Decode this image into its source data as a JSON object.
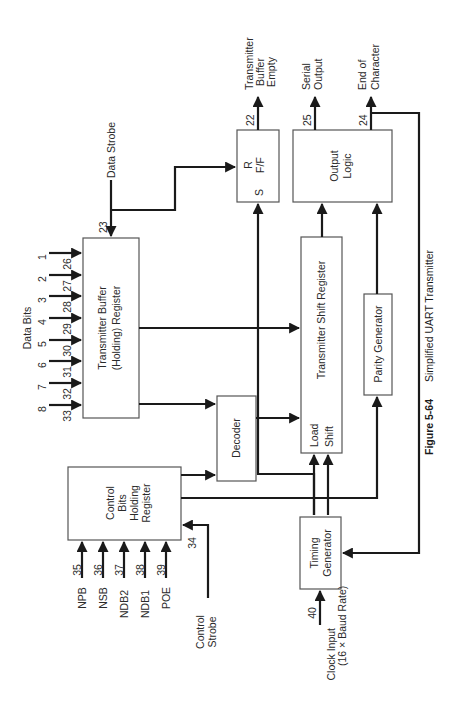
{
  "figure": {
    "number": "Figure 5-64",
    "title": "Simplified UART Transmitter"
  },
  "blocks": {
    "tbr": {
      "line1": "Transmitter Buffer",
      "line2": "(Holding) Register"
    },
    "decoder": {
      "label": "Decoder"
    },
    "cbhr": {
      "line1": "Control",
      "line2": "Bits",
      "line3": "Holding",
      "line4": "Register"
    },
    "rff": {
      "r": "R",
      "ff": "F/F",
      "s": "S"
    },
    "output_logic": {
      "line1": "Output",
      "line2": "Logic"
    },
    "tsr": {
      "label": "Transmitter Shift Register",
      "load": "Load",
      "shift": "Shift"
    },
    "parity": {
      "label": "Parity Generator"
    },
    "timing": {
      "line1": "Timing",
      "line2": "Generator"
    }
  },
  "signals": {
    "data_strobe": {
      "label": "Data Strobe",
      "pin": "23"
    },
    "data_bits": {
      "label": "Data Bits",
      "bits": [
        {
          "bit": "1",
          "pin": "26"
        },
        {
          "bit": "2",
          "pin": "27"
        },
        {
          "bit": "3",
          "pin": "28"
        },
        {
          "bit": "4",
          "pin": "29"
        },
        {
          "bit": "5",
          "pin": "30"
        },
        {
          "bit": "6",
          "pin": "31"
        },
        {
          "bit": "7",
          "pin": "32"
        },
        {
          "bit": "8",
          "pin": "33"
        }
      ]
    },
    "tbe": {
      "line1": "Transmitter",
      "line2": "Buffer",
      "line3": "Empty",
      "pin": "22"
    },
    "serial_output": {
      "line1": "Serial",
      "line2": "Output",
      "pin": "25"
    },
    "end_of_char": {
      "line1": "End of",
      "line2": "Character",
      "pin": "24"
    },
    "control_inputs": [
      {
        "name": "NPB",
        "pin": "35"
      },
      {
        "name": "NSB",
        "pin": "36"
      },
      {
        "name": "NDB2",
        "pin": "37"
      },
      {
        "name": "NDB1",
        "pin": "38"
      },
      {
        "name": "POE",
        "pin": "39"
      }
    ],
    "control_strobe": {
      "line1": "Control",
      "line2": "Strobe",
      "pin": "34"
    },
    "clock_input": {
      "line1": "Clock Input",
      "line2": "(16 × Baud Rate)",
      "pin": "40"
    }
  }
}
